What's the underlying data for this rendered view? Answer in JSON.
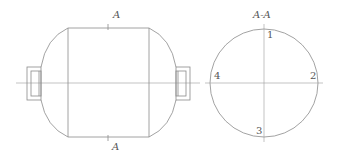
{
  "drawing": {
    "front_view": {
      "section_mark_top": "A",
      "section_mark_bottom": "A"
    },
    "section_view": {
      "title": "A-A",
      "points": [
        {
          "label": "1",
          "position": "top"
        },
        {
          "label": "2",
          "position": "right"
        },
        {
          "label": "3",
          "position": "bottom"
        },
        {
          "label": "4",
          "position": "left"
        }
      ]
    },
    "colors": {
      "line": "#8a8a8a",
      "text": "#555555",
      "background": "#ffffff"
    }
  }
}
